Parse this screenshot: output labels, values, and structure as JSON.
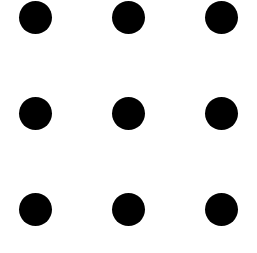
{
  "diagram": {
    "type": "dot-grid",
    "rows": 3,
    "columns": 3,
    "dot_color": "#000000",
    "background_color": "#ffffff",
    "dot_diameter": 33,
    "dots": [
      {
        "row": 0,
        "col": 0,
        "cx": 35,
        "cy": 17
      },
      {
        "row": 0,
        "col": 1,
        "cx": 128,
        "cy": 17
      },
      {
        "row": 0,
        "col": 2,
        "cx": 221,
        "cy": 17
      },
      {
        "row": 1,
        "col": 0,
        "cx": 35,
        "cy": 113
      },
      {
        "row": 1,
        "col": 1,
        "cx": 128,
        "cy": 113
      },
      {
        "row": 1,
        "col": 2,
        "cx": 221,
        "cy": 113
      },
      {
        "row": 2,
        "col": 0,
        "cx": 35,
        "cy": 209
      },
      {
        "row": 2,
        "col": 1,
        "cx": 128,
        "cy": 209
      },
      {
        "row": 2,
        "col": 2,
        "cx": 221,
        "cy": 209
      }
    ]
  }
}
